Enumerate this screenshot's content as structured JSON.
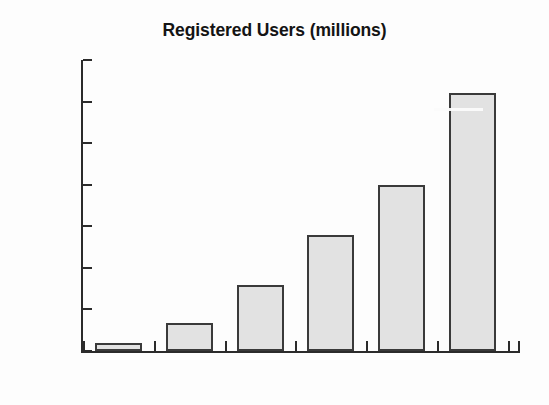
{
  "chart_data": {
    "type": "bar",
    "title": "Registered Users (millions)",
    "xlabel": "",
    "ylabel": "",
    "categories": [
      "1999",
      "2000",
      "2001",
      "2002",
      "2003",
      "2004"
    ],
    "values": [
      4,
      13.5,
      32,
      56,
      80,
      124
    ],
    "series": [
      {
        "name": "Registered Users (millions)",
        "values": [
          4,
          13.5,
          32,
          56,
          80,
          124
        ]
      }
    ],
    "ylim": [
      0,
      140
    ],
    "ytick_labels": [
      "0",
      "20",
      "40",
      "60",
      "80",
      "100",
      "120",
      "140"
    ],
    "ytick_values": [
      0,
      20,
      40,
      60,
      80,
      100,
      120,
      140
    ],
    "ystep": 20,
    "grid": false,
    "legend": false,
    "legend_position": "none",
    "bar_fill_color": "#e2e2e2",
    "bar_border_color": "#3a3a3a",
    "axis_color": "#2b2b2b",
    "background_color": "#fdfdfd",
    "text_color": "#1a1a1a",
    "annotations": []
  }
}
